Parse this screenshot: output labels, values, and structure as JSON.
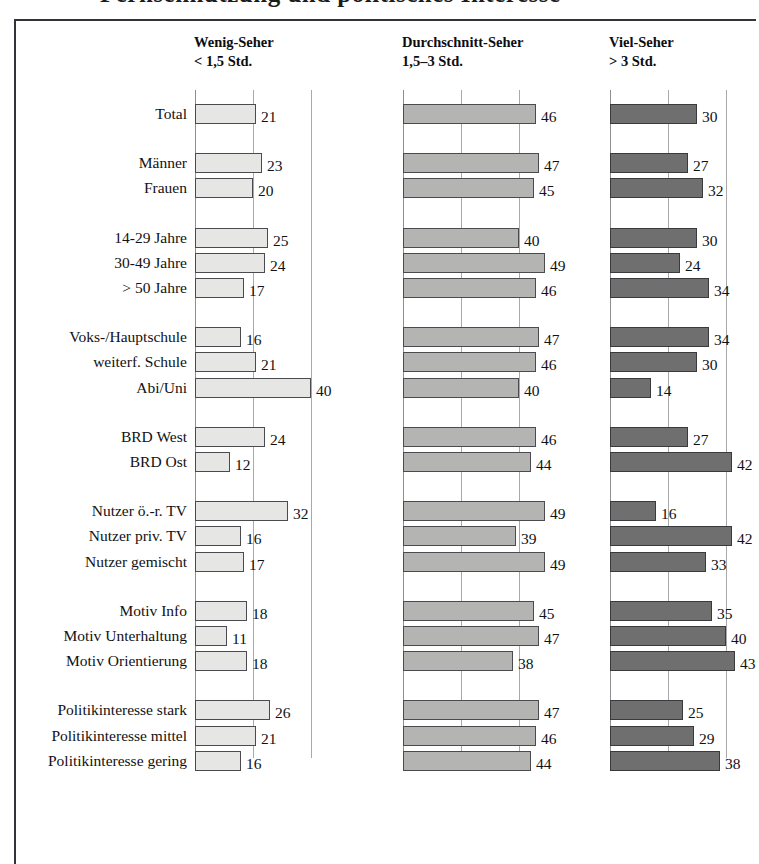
{
  "title_fragment": "Fernsehnutzung und politisches Interesse",
  "columns": [
    {
      "id": "wenig",
      "label": "Wenig-Seher",
      "sub": "< 1,5 Std.",
      "color": "#e6e6e4"
    },
    {
      "id": "durchschnitt",
      "label": "Durchschnitt-Seher",
      "sub": "1,5–3 Std.",
      "color": "#b4b4b2"
    },
    {
      "id": "viel",
      "label": "Viel-Seher",
      "sub": "> 3 Std.",
      "color": "#6f6f70"
    }
  ],
  "chart_data": {
    "type": "bar",
    "title": "Fernsehnutzung und politisches Interesse",
    "xlabel": "",
    "ylabel": "",
    "xlim": [
      0,
      50
    ],
    "grid": true,
    "legend_position": "top",
    "orientation": "horizontal",
    "panels": [
      "Wenig-Seher < 1,5 Std.",
      "Durchschnitt-Seher 1,5–3 Std.",
      "Viel-Seher > 3 Std."
    ],
    "categories": [
      "Total",
      "Männer",
      "Frauen",
      "14-29 Jahre",
      "30-49 Jahre",
      "> 50 Jahre",
      "Voks-/Hauptschule",
      "weiterf. Schule",
      "Abi/Uni",
      "BRD West",
      "BRD Ost",
      "Nutzer ö.-r. TV",
      "Nutzer priv. TV",
      "Nutzer gemischt",
      "Motiv Info",
      "Motiv Unterhaltung",
      "Motiv Orientierung",
      "Politikinteresse stark",
      "Politikinteresse mittel",
      "Politikinteresse gering"
    ],
    "series": [
      {
        "name": "Wenig-Seher < 1,5 Std.",
        "values": [
          21,
          23,
          20,
          25,
          24,
          17,
          16,
          21,
          40,
          24,
          12,
          32,
          16,
          17,
          18,
          11,
          18,
          26,
          21,
          16
        ]
      },
      {
        "name": "Durchschnitt-Seher 1,5–3 Std.",
        "values": [
          46,
          47,
          45,
          40,
          49,
          46,
          47,
          46,
          40,
          46,
          44,
          49,
          39,
          49,
          45,
          47,
          38,
          47,
          46,
          44
        ]
      },
      {
        "name": "Viel-Seher > 3 Std.",
        "values": [
          30,
          27,
          32,
          30,
          24,
          34,
          34,
          30,
          14,
          27,
          42,
          16,
          42,
          33,
          35,
          40,
          43,
          25,
          29,
          38
        ]
      }
    ],
    "groups": [
      {
        "rows": [
          "Total"
        ]
      },
      {
        "rows": [
          "Männer",
          "Frauen"
        ]
      },
      {
        "rows": [
          "14-29 Jahre",
          "30-49 Jahre",
          "> 50 Jahre"
        ]
      },
      {
        "rows": [
          "Voks-/Hauptschule",
          "weiterf. Schule",
          "Abi/Uni"
        ]
      },
      {
        "rows": [
          "BRD West",
          "BRD Ost"
        ]
      },
      {
        "rows": [
          "Nutzer ö.-r. TV",
          "Nutzer priv. TV",
          "Nutzer gemischt"
        ]
      },
      {
        "rows": [
          "Motiv Info",
          "Motiv Unterhaltung",
          "Motiv Orientierung"
        ]
      },
      {
        "rows": [
          "Politikinteresse stark",
          "Politikinteresse mittel",
          "Politikinteresse gering"
        ]
      }
    ]
  }
}
